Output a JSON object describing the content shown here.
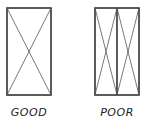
{
  "diagrams": [
    {
      "label": "GOOD",
      "panels": 1,
      "description": "Single tall rectangle with one X cross-brace"
    },
    {
      "label": "POOR",
      "panels": 2,
      "description": "Tall rectangle split into two narrow panels, each with an X cross-brace"
    }
  ],
  "colors": {
    "stroke": "#333333",
    "thin_stroke": "#555555",
    "background": "#ffffff"
  }
}
